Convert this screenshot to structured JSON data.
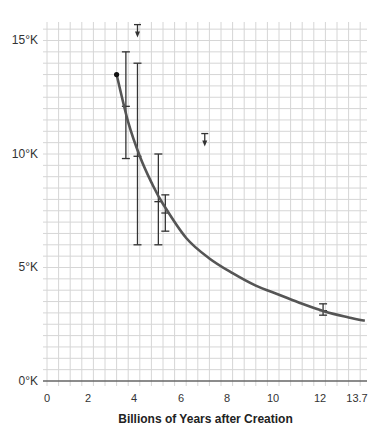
{
  "chart_data": {
    "type": "line",
    "title": "",
    "xlabel": "Billions of Years after Creation",
    "ylabel": "",
    "xlim": [
      0,
      13.7
    ],
    "ylim": [
      0,
      15.5
    ],
    "grid": true,
    "x_ticks": [
      "0",
      "2",
      "4",
      "6",
      "8",
      "10",
      "12",
      "13.7"
    ],
    "x_tick_values": [
      0,
      2,
      4,
      6,
      8,
      10,
      12,
      13.7
    ],
    "y_ticks": [
      "0°K",
      "5°K",
      "10°K",
      "15°K"
    ],
    "y_tick_values": [
      0,
      5,
      10,
      15
    ],
    "series": [
      {
        "name": "temperature-curve",
        "kind": "line",
        "x": [
          3.0,
          3.5,
          4.0,
          4.5,
          5.0,
          6.0,
          7.0,
          8.0,
          9.0,
          10.0,
          11.0,
          12.0,
          13.0,
          13.7
        ],
        "y": [
          13.5,
          11.4,
          9.9,
          8.75,
          7.8,
          6.3,
          5.4,
          4.75,
          4.2,
          3.8,
          3.4,
          3.05,
          2.8,
          2.65
        ],
        "start_marker": "filled-dot"
      },
      {
        "name": "measurements",
        "kind": "errorbar",
        "points": [
          {
            "x": 3.4,
            "y": 12.1,
            "low": 9.8,
            "high": 14.5
          },
          {
            "x": 3.9,
            "y": 9.9,
            "low": 6.0,
            "high": 14.0
          },
          {
            "x": 4.8,
            "y": 7.9,
            "low": 6.0,
            "high": 10.0
          },
          {
            "x": 5.1,
            "y": 7.4,
            "low": 6.6,
            "high": 8.2
          },
          {
            "x": 11.9,
            "y": 3.1,
            "low": 2.9,
            "high": 3.4
          }
        ]
      },
      {
        "name": "upper-limits",
        "kind": "upper-limit-arrow",
        "points": [
          {
            "x": 3.9,
            "y": 15.7
          },
          {
            "x": 6.8,
            "y": 10.9
          }
        ]
      }
    ],
    "colors": {
      "curve": "#555555",
      "errorbar": "#333333",
      "grid": "#d6d6d6",
      "axis": "#666666"
    }
  }
}
